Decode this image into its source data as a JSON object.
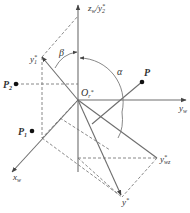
{
  "diagram": {
    "colors": {
      "line": "#6e6e6e",
      "dash": "#7a7a7a",
      "text": "#333333",
      "point": "#111111"
    },
    "labels": {
      "z_axis": "z",
      "z_axis_sub": "w",
      "z_axis_sep": "/",
      "z_axis_y2": "y",
      "z_axis_y2_sup": "*",
      "z_axis_y2_sub": "2",
      "y1": "y",
      "y1_sup": "*",
      "y1_sub": "1",
      "beta": "β",
      "alpha": "α",
      "origin": "O",
      "origin_sub": "r",
      "origin_sup": "*",
      "p": "P",
      "p1": "P",
      "p1_sub": "1",
      "p2": "P",
      "p2_sub": "2",
      "y_axis": "y",
      "y_axis_sub": "w",
      "x_axis": "x",
      "x_axis_sub": "w",
      "ywz": "y",
      "ywz_sup": "*",
      "ywz_sub": "wz",
      "y_star": "y",
      "y_star_sup": "*"
    }
  }
}
